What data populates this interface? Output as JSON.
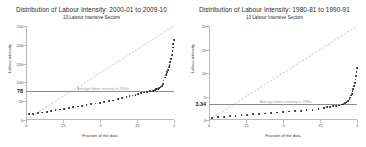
{
  "panels": [
    {
      "title": "Distribution of Labour Intensity: 2000-01 to 2009-10",
      "subtitle": "13 Labour Intensive Sectors",
      "axis_title_y": "Labour intensity",
      "axis_title_x": "Fraction of the data",
      "avg_note": "Average labour intensity in 2000s",
      "avg_value_label": "78",
      "y_ticks": [
        "0",
        "50",
        "100",
        "150",
        "200",
        "250"
      ],
      "x_ticks": [
        "0",
        ".25",
        ".5",
        ".75",
        "1"
      ]
    },
    {
      "title": "Distribution of Labour Intensity: 1980-81 to 1990-91",
      "subtitle": "13 Labour Intensive Sectors",
      "axis_title_y": "Labour intensity",
      "axis_title_x": "Fraction of the data",
      "avg_note": "Average labour intensity in 1980s",
      "avg_value_label": "3.34",
      "y_ticks": [
        "0",
        "5",
        "10",
        "15",
        "20"
      ],
      "x_ticks": [
        "0",
        ".25",
        ".5",
        ".75",
        "1"
      ]
    }
  ],
  "chart_data": [
    {
      "type": "scatter",
      "title": "Distribution of Labour Intensity: 2000-01 to 2009-10",
      "subtitle": "13 Labour Intensive Sectors",
      "xlabel": "Fraction of the data",
      "ylabel": "Labour intensity",
      "xlim": [
        0,
        1
      ],
      "ylim": [
        0,
        250
      ],
      "xticks": [
        0,
        0.25,
        0.5,
        0.75,
        1
      ],
      "yticks": [
        0,
        50,
        100,
        150,
        200,
        250
      ],
      "grid": false,
      "legend": "none",
      "annotations": [
        {
          "text": "Average labour intensity in 2000s",
          "y": 78,
          "type": "hline-label"
        }
      ],
      "reference_lines": [
        {
          "name": "average-line",
          "kind": "horizontal",
          "y": 78
        },
        {
          "name": "identity-line",
          "kind": "diagonal",
          "from": [
            0,
            0
          ],
          "to": [
            1,
            250
          ],
          "style": "dashed"
        }
      ],
      "series": [
        {
          "name": "Labour intensity quantiles",
          "x": [
            0.02,
            0.05,
            0.08,
            0.11,
            0.14,
            0.17,
            0.2,
            0.23,
            0.26,
            0.29,
            0.32,
            0.35,
            0.38,
            0.41,
            0.44,
            0.47,
            0.5,
            0.53,
            0.56,
            0.59,
            0.62,
            0.65,
            0.68,
            0.7,
            0.72,
            0.74,
            0.76,
            0.78,
            0.8,
            0.82,
            0.84,
            0.86,
            0.87,
            0.88,
            0.89,
            0.9,
            0.91,
            0.92,
            0.925,
            0.93,
            0.94,
            0.945,
            0.95,
            0.955,
            0.96,
            0.965,
            0.97,
            0.975,
            0.98,
            0.985,
            0.99,
            0.993,
            0.996,
            0.999
          ],
          "y": [
            20,
            21,
            23,
            25,
            27,
            29,
            31,
            33,
            35,
            37,
            39,
            41,
            43,
            45,
            47,
            49,
            51,
            53,
            55,
            57,
            60,
            63,
            66,
            68,
            70,
            72,
            74,
            76,
            78,
            80,
            82,
            83,
            85,
            87,
            88,
            90,
            92,
            95,
            100,
            110,
            118,
            124,
            128,
            132,
            138,
            145,
            152,
            160,
            168,
            178,
            188,
            198,
            208,
            218
          ]
        }
      ]
    },
    {
      "type": "scatter",
      "title": "Distribution of Labour Intensity: 1980-81 to 1990-91",
      "subtitle": "13 Labour Intensive Sectors",
      "xlabel": "Fraction of the data",
      "ylabel": "Labour intensity",
      "xlim": [
        0,
        1
      ],
      "ylim": [
        0,
        20
      ],
      "xticks": [
        0,
        0.25,
        0.5,
        0.75,
        1
      ],
      "yticks": [
        0,
        5,
        10,
        15,
        20
      ],
      "grid": false,
      "legend": "none",
      "annotations": [
        {
          "text": "Average labour intensity in 1980s",
          "y": 3.34,
          "type": "hline-label"
        }
      ],
      "reference_lines": [
        {
          "name": "average-line",
          "kind": "horizontal",
          "y": 3.34
        },
        {
          "name": "identity-line",
          "kind": "diagonal",
          "from": [
            0,
            0
          ],
          "to": [
            1,
            20
          ],
          "style": "dashed"
        }
      ],
      "series": [
        {
          "name": "Labour intensity quantiles",
          "x": [
            0.02,
            0.06,
            0.1,
            0.14,
            0.18,
            0.22,
            0.26,
            0.3,
            0.34,
            0.38,
            0.42,
            0.46,
            0.5,
            0.54,
            0.58,
            0.62,
            0.66,
            0.7,
            0.74,
            0.78,
            0.8,
            0.82,
            0.84,
            0.86,
            0.88,
            0.9,
            0.91,
            0.92,
            0.93,
            0.94,
            0.95,
            0.955,
            0.96,
            0.965,
            0.97,
            0.975,
            0.98,
            0.985,
            0.99,
            0.994,
            0.997,
            0.999
          ],
          "y": [
            0.9,
            1.0,
            1.1,
            1.2,
            1.3,
            1.4,
            1.5,
            1.6,
            1.7,
            1.8,
            1.9,
            2.0,
            2.1,
            2.2,
            2.3,
            2.4,
            2.5,
            2.6,
            2.8,
            3.0,
            3.1,
            3.2,
            3.3,
            3.4,
            3.5,
            3.7,
            3.8,
            4.0,
            4.2,
            4.5,
            4.9,
            5.2,
            5.6,
            6.0,
            6.5,
            7.0,
            7.6,
            8.3,
            9.0,
            9.8,
            10.6,
            11.4
          ]
        }
      ]
    }
  ]
}
